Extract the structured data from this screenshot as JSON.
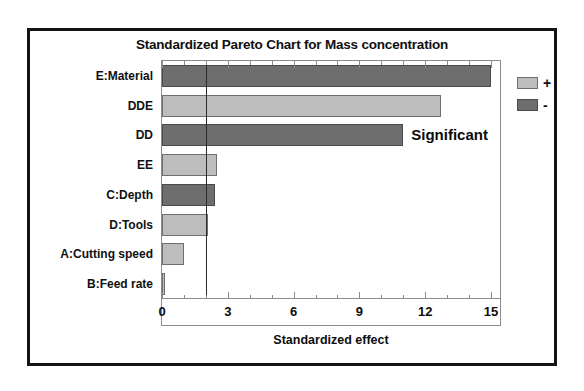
{
  "chart_data": {
    "type": "bar",
    "orientation": "horizontal",
    "title": "Standardized Pareto Chart for Mass concentration",
    "xlabel": "Standardized effect",
    "ylabel": "",
    "xlim": [
      0,
      15.5
    ],
    "xticks": [
      0,
      3,
      6,
      9,
      12,
      15
    ],
    "xtick_labels": [
      "0",
      "3",
      "6",
      "9",
      "12",
      "15"
    ],
    "minor_ticks_between": 2,
    "grid": false,
    "categories": [
      "E:Material",
      "DDE",
      "DD",
      "EE",
      "C:Depth",
      "D:Tools",
      "A:Cutting speed",
      "B:Feed rate"
    ],
    "values": [
      15.0,
      12.7,
      11.0,
      2.5,
      2.4,
      2.1,
      1.0,
      0.1
    ],
    "signs": [
      "-",
      "+",
      "-",
      "+",
      "-",
      "+",
      "+",
      "+"
    ],
    "bars": [
      {
        "label": "E:Material",
        "value": 15.0,
        "sign": "-"
      },
      {
        "label": "DDE",
        "value": 12.7,
        "sign": "+"
      },
      {
        "label": "DD",
        "value": 11.0,
        "sign": "-"
      },
      {
        "label": "EE",
        "value": 2.5,
        "sign": "+"
      },
      {
        "label": "C:Depth",
        "value": 2.4,
        "sign": "-"
      },
      {
        "label": "D:Tools",
        "value": 2.1,
        "sign": "+"
      },
      {
        "label": "A:Cutting speed",
        "value": 1.0,
        "sign": "+"
      },
      {
        "label": "B:Feed rate",
        "value": 0.1,
        "sign": "+"
      }
    ],
    "reference_line": {
      "value": 2.0,
      "label": "Significant"
    },
    "legend": {
      "position": "right",
      "entries": [
        {
          "symbol": "+",
          "sign": "positive",
          "color": "#bdbdbd"
        },
        {
          "symbol": "-",
          "sign": "negative",
          "color": "#6e6e6e"
        }
      ]
    },
    "colors": {
      "positive": "#bdbdbd",
      "negative": "#6e6e6e",
      "frame": "#141414",
      "axis": "#8c8c8c",
      "reference_line": "#2b2b2b",
      "text": "#101010",
      "background": "#ffffff"
    }
  },
  "annotations": {
    "significant_label": "Significant"
  }
}
